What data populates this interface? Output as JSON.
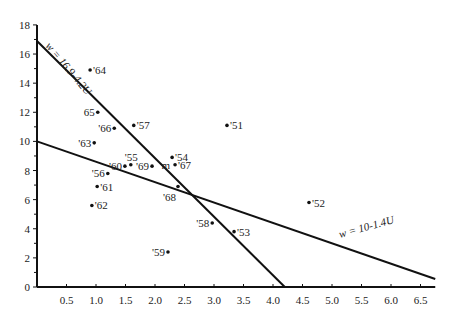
{
  "chart_data": {
    "type": "scatter",
    "title": "",
    "xlabel": "",
    "ylabel": "",
    "xlim": [
      0,
      6.75
    ],
    "ylim": [
      0,
      18
    ],
    "grid": false,
    "x_ticks": [
      "0.5",
      "1.0",
      "1.5",
      "2.0",
      "2.5",
      "3.0",
      "3.5",
      "4.0",
      "4.5",
      "5.0",
      "5.5",
      "6.0",
      "6.5"
    ],
    "x_tick_values": [
      0.5,
      1.0,
      1.5,
      2.0,
      2.5,
      3.0,
      3.5,
      4.0,
      4.5,
      5.0,
      5.5,
      6.0,
      6.5
    ],
    "y_ticks": [
      "0",
      "2",
      "4",
      "6",
      "8",
      "10",
      "12",
      "14",
      "16",
      "18"
    ],
    "y_tick_values": [
      0,
      2,
      4,
      6,
      8,
      10,
      12,
      14,
      16,
      18
    ],
    "points": [
      {
        "label": "'51",
        "x": 3.22,
        "y": 11.1,
        "label_side": "right"
      },
      {
        "label": "'52",
        "x": 4.61,
        "y": 5.8,
        "label_side": "right"
      },
      {
        "label": "'53",
        "x": 3.34,
        "y": 3.8,
        "label_side": "right"
      },
      {
        "label": "'54",
        "x": 2.29,
        "y": 8.9,
        "label_side": "right"
      },
      {
        "label": "'55",
        "x": 1.59,
        "y": 8.4,
        "label_side": "above"
      },
      {
        "label": "'56",
        "x": 1.2,
        "y": 7.8,
        "label_side": "left"
      },
      {
        "label": "'57",
        "x": 1.64,
        "y": 11.1,
        "label_side": "right"
      },
      {
        "label": "'58",
        "x": 2.97,
        "y": 4.4,
        "label_side": "left"
      },
      {
        "label": "'59",
        "x": 2.22,
        "y": 2.4,
        "label_side": "left"
      },
      {
        "label": "'60",
        "x": 1.49,
        "y": 8.3,
        "label_side": "left"
      },
      {
        "label": "'61",
        "x": 1.02,
        "y": 6.9,
        "label_side": "right"
      },
      {
        "label": "'62",
        "x": 0.93,
        "y": 5.6,
        "label_side": "right"
      },
      {
        "label": "'63",
        "x": 0.97,
        "y": 9.9,
        "label_side": "left"
      },
      {
        "label": "'64",
        "x": 0.9,
        "y": 14.9,
        "label_side": "right"
      },
      {
        "label": "65",
        "x": 1.03,
        "y": 12.0,
        "label_side": "left"
      },
      {
        "label": "'66",
        "x": 1.31,
        "y": 10.9,
        "label_side": "left"
      },
      {
        "label": "'67",
        "x": 2.34,
        "y": 8.4,
        "label_side": "right"
      },
      {
        "label": "'68",
        "x": 2.39,
        "y": 6.9,
        "label_side": "below-left"
      },
      {
        "label": "'69",
        "x": 1.95,
        "y": 8.3,
        "label_side": "left"
      }
    ],
    "extra_marker": {
      "label": "m",
      "x": 2.25,
      "y": 8.4
    },
    "lines": [
      {
        "name": "w = 16.9-4.2U",
        "intercept": 16.9,
        "slope": -4.2,
        "x_range": [
          0,
          4.2
        ],
        "label": "w = 16.9-4.2U"
      },
      {
        "name": "w = 10-1.4U",
        "intercept": 10.0,
        "slope": -1.4,
        "x_range": [
          0,
          6.75
        ],
        "label": "w = 10-1.4U"
      }
    ]
  },
  "line_labels": {
    "steep": "w = 16.9-4.2U",
    "shallow": "w = 10-1.4U"
  }
}
